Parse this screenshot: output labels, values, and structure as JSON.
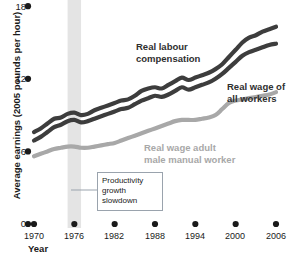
{
  "chart_data": {
    "type": "line",
    "title": "",
    "xlabel": "Year",
    "ylabel": "Average earnings (2005 pounds per hour)",
    "xlim": [
      1970,
      2006
    ],
    "ylim": [
      0,
      18
    ],
    "yticks": [
      "0",
      "6",
      "12",
      "18"
    ],
    "ytick_values": [
      0,
      6,
      12,
      18
    ],
    "xticks": [
      "1970",
      "1976",
      "1982",
      "1988",
      "1994",
      "2000",
      "2006"
    ],
    "xtick_values": [
      1970,
      1976,
      1982,
      1988,
      1994,
      2000,
      2006
    ],
    "grid": false,
    "legend": "inline-labels",
    "x": [
      1970,
      1971,
      1972,
      1973,
      1974,
      1975,
      1976,
      1977,
      1978,
      1979,
      1980,
      1981,
      1982,
      1983,
      1984,
      1985,
      1986,
      1987,
      1988,
      1989,
      1990,
      1991,
      1992,
      1993,
      1994,
      1995,
      1996,
      1997,
      1998,
      1999,
      2000,
      2001,
      2002,
      2003,
      2004,
      2005,
      2006
    ],
    "series": [
      {
        "name": "Real labour compensation",
        "color": "#3d3d3d",
        "values": [
          7.6,
          7.9,
          8.3,
          8.7,
          8.8,
          9.1,
          9.2,
          9.0,
          9.1,
          9.4,
          9.6,
          9.8,
          10.0,
          10.2,
          10.3,
          10.6,
          11.0,
          11.2,
          11.3,
          11.2,
          11.5,
          11.8,
          12.1,
          11.9,
          12.1,
          12.3,
          12.5,
          12.8,
          13.2,
          13.8,
          14.4,
          15.0,
          15.4,
          15.6,
          15.9,
          16.1,
          16.3
        ]
      },
      {
        "name": "Real wage of all workers",
        "color": "#3d3d3d",
        "values": [
          6.9,
          7.2,
          7.6,
          8.0,
          8.2,
          8.5,
          8.6,
          8.4,
          8.5,
          8.7,
          8.9,
          9.1,
          9.3,
          9.5,
          9.6,
          9.9,
          10.2,
          10.4,
          10.6,
          10.5,
          10.7,
          11.0,
          11.3,
          11.1,
          11.3,
          11.5,
          11.7,
          12.0,
          12.4,
          12.9,
          13.4,
          13.9,
          14.2,
          14.4,
          14.6,
          14.8,
          14.9
        ]
      },
      {
        "name": "Real wage adult male manual worker",
        "color": "#a8a8a8",
        "values": [
          5.6,
          5.8,
          6.0,
          6.2,
          6.3,
          6.4,
          6.4,
          6.3,
          6.3,
          6.4,
          6.5,
          6.6,
          6.7,
          6.9,
          7.1,
          7.3,
          7.5,
          7.7,
          7.9,
          8.1,
          8.3,
          8.5,
          8.6,
          8.6,
          8.6,
          8.7,
          8.8,
          9.0,
          9.5,
          10.0,
          10.2,
          10.3,
          10.4,
          10.5,
          10.6,
          10.7,
          10.9
        ]
      }
    ],
    "annotations": [
      {
        "name": "productivity-growth-slowdown",
        "text": "Productivity\ngrowth\nslowdown",
        "band_start": 1975,
        "band_end": 1977,
        "band_color": "#e4e4e4"
      }
    ],
    "series_labels": [
      {
        "text": "Real labour\ncompensation",
        "color": "#2f2f2f"
      },
      {
        "text": "Real wage of\nall workers",
        "color": "#2f2f2f"
      },
      {
        "text": "Real wage adult\nmale manual worker",
        "color": "#a8a8a8"
      }
    ]
  }
}
